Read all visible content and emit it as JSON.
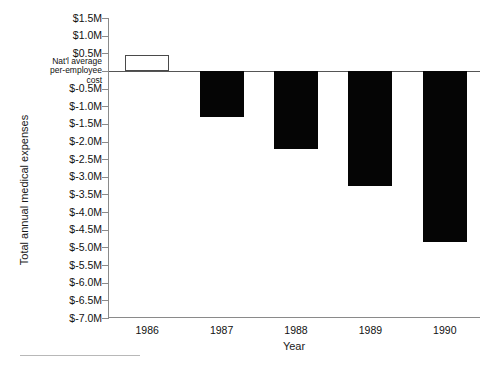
{
  "chart_data": {
    "type": "bar",
    "title": "",
    "subtitle": "",
    "xlabel": "Year",
    "ylabel": "Total annual medical expenses",
    "categories": [
      "1986",
      "1987",
      "1988",
      "1989",
      "1990"
    ],
    "values": [
      0.45,
      -1.3,
      -2.2,
      -3.25,
      -4.85
    ],
    "value_unit": "millions of dollars",
    "ylim": [
      -7.0,
      1.5
    ],
    "ytick_values": [
      1.5,
      1.0,
      0.5,
      0.0,
      -0.5,
      -1.0,
      -1.5,
      -2.0,
      -2.5,
      -3.0,
      -3.5,
      -4.0,
      -4.5,
      -5.0,
      -5.5,
      -6.0,
      -6.5,
      -7.0
    ],
    "ytick_labels": [
      "$1.5M",
      "$1.0M",
      "$0.5M",
      "Nat'l average\nper-employee\ncost",
      "$-0.5M",
      "$-1.0M",
      "$-1.5M",
      "$-2.0M",
      "$-2.5M",
      "$-3.0M",
      "$-3.5M",
      "$-4.0M",
      "$-4.5M",
      "$-5.0M",
      "$-5.5M",
      "$-6.0M",
      "$-6.5M",
      "$-7.0M"
    ],
    "zero_reference_label": "Nat'l average per-employee cost",
    "grid": false,
    "legend": "none",
    "series": [
      {
        "name": "Total annual medical expenses",
        "values": [
          0.45,
          -1.3,
          -2.2,
          -3.25,
          -4.85
        ],
        "bar_styles": [
          "outline",
          "filled",
          "filled",
          "filled",
          "filled"
        ]
      }
    ],
    "colors": {
      "bar_negative_fill": "#050505",
      "bar_positive_fill": "#ffffff",
      "bar_positive_border": "#4a4a4a",
      "axis": "#8a8a8a",
      "zero_line": "#555555",
      "text": "#111111",
      "background": "#ffffff"
    }
  }
}
